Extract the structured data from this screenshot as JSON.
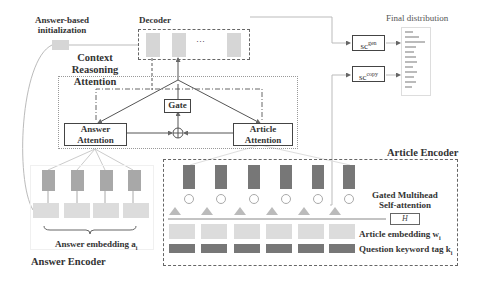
{
  "labels": {
    "answer_init": "Answer-based initialization",
    "answer_init_l1": "Answer-based",
    "answer_init_l2": "initialization",
    "decoder": "Decoder",
    "context_reasoning_l1": "Context Reasoning",
    "context_reasoning_l2": "Attention",
    "gate": "Gate",
    "answer_attention_l1": "Answer",
    "answer_attention_l2": "Attention",
    "article_attention_l1": "Article",
    "article_attention_l2": "Attention",
    "final_distribution": "Final distribution",
    "sc_gen": "sc",
    "sc_gen_sup": "gen",
    "sc_copy": "sc",
    "sc_copy_sup": "copy",
    "article_encoder": "Article Encoder",
    "gated_multihead_l1": "Gated Multihead",
    "gated_multihead_l2": "Self-attention",
    "h_box": "H",
    "article_embedding": "Article embedding w",
    "article_embedding_sub": "i",
    "question_keyword": "Question keyword tag k",
    "question_keyword_sub": "i",
    "answer_embedding": "Answer embedding a",
    "answer_embedding_sub": "i",
    "answer_encoder": "Answer Encoder",
    "ellipsis": "···"
  },
  "colors": {
    "light_cell": "#d6d6d6",
    "dark_cell": "#777777",
    "mid_cell": "#a8a8a8",
    "line": "#555555"
  }
}
